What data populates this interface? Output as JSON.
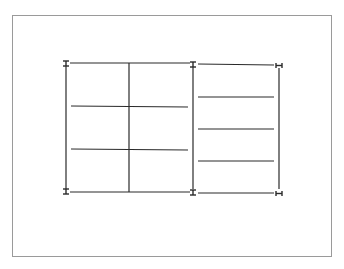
{
  "figure": {
    "colors": {
      "line": "#2a2a2a",
      "border": "#9a9a9a",
      "background": "#ffffff"
    },
    "left_section": {
      "outer": {
        "x1": 66,
        "y1": 63,
        "x2": 193,
        "y2": 192
      },
      "center_divider_x": 129,
      "horizontal_lines_y": [
        106,
        149
      ],
      "end_markers": [
        "I-beam",
        "I-beam"
      ]
    },
    "right_section": {
      "outer": {
        "x1": 193,
        "y1": 64,
        "x2": 279,
        "y2": 193
      },
      "horizontal_lines_y": [
        97,
        129,
        161
      ],
      "end_markers": [
        "I-beam",
        "H-beam"
      ]
    }
  }
}
